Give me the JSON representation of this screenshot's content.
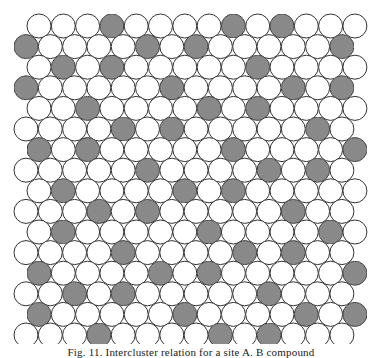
{
  "figure": {
    "type": "hexagonal circle packing",
    "rows": 16,
    "circles_per_row": 14,
    "layout": {
      "odd_row_first_center_x": 39,
      "even_row_first_center_x": 26,
      "spacing_x": 24.3,
      "first_row_center_y": 26,
      "spacing_y": 20.6,
      "radius": 12
    },
    "colors": {
      "outline": "#333333",
      "open_fill": "#ffffff",
      "shaded_fill": "#8a8a8a"
    },
    "shaded_indices_by_row": [
      [
        3,
        8,
        10
      ],
      [
        0,
        5,
        7,
        13
      ],
      [
        1,
        3,
        9
      ],
      [
        0,
        6,
        11,
        13
      ],
      [
        2,
        7,
        9
      ],
      [
        4,
        6,
        12
      ],
      [
        0,
        2,
        8,
        13
      ],
      [
        5,
        10,
        12
      ],
      [
        1,
        6,
        8
      ],
      [
        3,
        5,
        11
      ],
      [
        1,
        7,
        12
      ],
      [
        4,
        9,
        11
      ],
      [
        0,
        5,
        7,
        13
      ],
      [
        2,
        4,
        10
      ],
      [
        0,
        6,
        11,
        13
      ],
      [
        3,
        8,
        10
      ]
    ]
  },
  "caption": {
    "text": "Fig. 11. Intercluster relation for a site A. B compound"
  }
}
